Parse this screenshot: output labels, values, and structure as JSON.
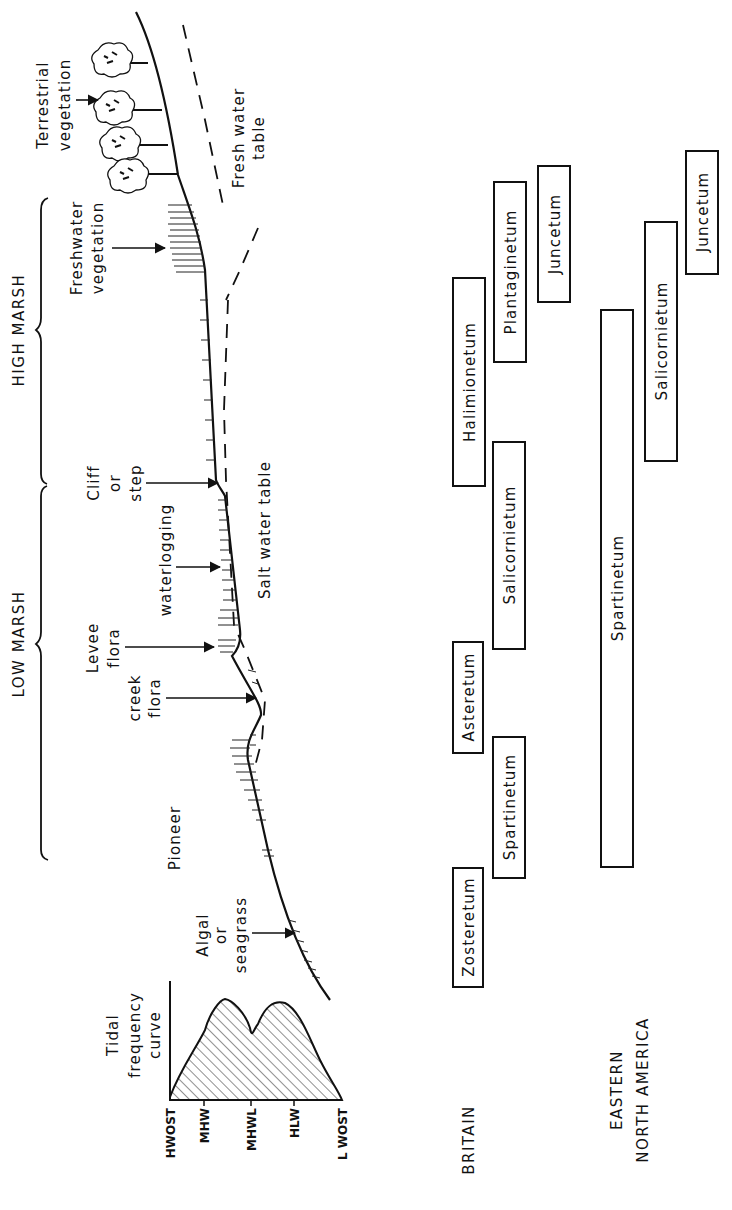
{
  "diagram": {
    "orientation": "rotated 90 degrees counter-clockwise",
    "zones": {
      "high_marsh": "HIGH MARSH",
      "low_marsh": "LOW MARSH"
    },
    "profile_labels": {
      "terrestrial": [
        "Terrestrial",
        "vegetation"
      ],
      "fresh_water_table": [
        "Fresh water",
        "table"
      ],
      "freshwater_vegetation": [
        "Freshwater",
        "vegetation"
      ],
      "cliff": [
        "Cliff",
        "or",
        "step"
      ],
      "waterlogging": "waterlogging",
      "salt_water_table": "Salt water table",
      "levee": [
        "Levee",
        "flora"
      ],
      "creek": [
        "creek",
        "flora"
      ],
      "pioneer": "Pioneer",
      "algal": [
        "Algal",
        "or",
        "seagrass"
      ]
    },
    "tidal_curve": {
      "title": [
        "Tidal",
        "frequency",
        "curve"
      ],
      "ticks": [
        "HWOST",
        "MHW",
        "MHWL",
        "HLW",
        "L WOST"
      ]
    },
    "regions": {
      "britain": "BRITAIN",
      "na_line1": "EASTERN",
      "na_line2": "NORTH AMERICA"
    },
    "britain_communities": [
      {
        "name": "Zosteretum"
      },
      {
        "name": "Spartinetum"
      },
      {
        "name": "Asteretum"
      },
      {
        "name": "Salicornietum"
      },
      {
        "name": "Halimionetum"
      },
      {
        "name": "Plantaginetum"
      },
      {
        "name": "Juncetum"
      }
    ],
    "north_america_communities": [
      {
        "name": "Spartinetum"
      },
      {
        "name": "Salicornietum"
      },
      {
        "name": "Juncetum"
      }
    ]
  }
}
